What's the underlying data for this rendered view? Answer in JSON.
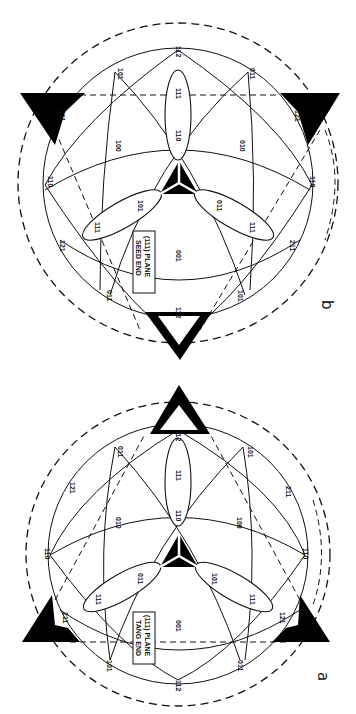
{
  "figure": {
    "orientation": "rotated 90 degrees clockwise",
    "panels": [
      {
        "id": "b",
        "panel_label": "b",
        "box_label_line1": "(111) PLANE",
        "box_label_line2": "SEED END",
        "labels": {
          "top": "112",
          "upper_left": "101",
          "upper_right": "011",
          "ellipse_top_outer": "111",
          "ellipse_top_inner": "110",
          "left_tri": "211",
          "right_tri": "121",
          "mid_left": "100",
          "mid_right": "010",
          "far_left": "110",
          "far_right": "110",
          "ellipse_left_inner": "101",
          "ellipse_left_outer": "111",
          "ellipse_right_inner": "011",
          "ellipse_right_outer": "111",
          "lower_left": "121",
          "lower_right": "211",
          "bottom_center": "001",
          "bottom_left": "011",
          "bottom_right": "101",
          "bottom": "112"
        }
      },
      {
        "id": "a",
        "panel_label": "a",
        "box_label_line1": "(111) PLANE",
        "box_label_line2": "TANG END",
        "labels": {
          "top": "112",
          "upper_left": "011",
          "upper_right": "101",
          "ellipse_top_outer": "111",
          "ellipse_top_inner": "110",
          "left_upper": "121",
          "right_upper": "211",
          "mid_left": "010",
          "mid_right": "100",
          "far_left": "110",
          "far_right": "110",
          "ellipse_left_inner": "011",
          "ellipse_left_outer": "111",
          "ellipse_right_inner": "101",
          "ellipse_right_outer": "111",
          "left_tri": "211",
          "right_tri": "121",
          "bottom_center": "001",
          "bottom_left": "101",
          "bottom_right": "011",
          "bottom": "112"
        }
      }
    ]
  }
}
